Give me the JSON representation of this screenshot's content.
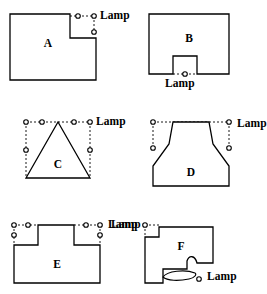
{
  "figure": {
    "stroke_color": "#000000",
    "fill_color": "#ffffff",
    "lamp_marker": "small-open-circle",
    "guide_style": "dashed",
    "panels": [
      {
        "id": "A",
        "label": "A",
        "lamp_label": "Lamp",
        "lamp_count": 3,
        "shape": "rectilinear-L-shape",
        "outline": "M10,14 L70,14 L70,38 L96,38 L96,80 L10,80 Z",
        "label_x": 48,
        "label_y": 47,
        "guides": [
          {
            "x1": 70,
            "y1": 16,
            "x2": 96,
            "y2": 16
          },
          {
            "x1": 94,
            "y1": 16,
            "x2": 94,
            "y2": 33
          }
        ],
        "lamps": [
          {
            "cx": 78,
            "cy": 16
          },
          {
            "cx": 94,
            "cy": 16
          },
          {
            "cx": 94,
            "cy": 32
          }
        ],
        "lamp_label_x": 100,
        "lamp_label_y": 10
      },
      {
        "id": "B",
        "label": "B",
        "lamp_label": "Lamp",
        "lamp_count": 1,
        "shape": "rectangle-with-bottom-notch",
        "outline": "M16,14 L96,14 L96,74 L64,74 L64,56 L40,56 L40,74 L16,74 Z",
        "label_x": 56,
        "label_y": 42,
        "guides": [
          {
            "x1": 40,
            "y1": 74,
            "x2": 64,
            "y2": 74
          }
        ],
        "lamps": [
          {
            "cx": 52,
            "cy": 74
          }
        ],
        "lamp_label_x": 32,
        "lamp_label_y": 78
      },
      {
        "id": "C",
        "label": "C",
        "lamp_label": "Lamp",
        "lamp_count": 6,
        "shape": "triangle-with-bounding-box",
        "outline": "M58,24 L90,80 L26,80 Z",
        "label_x": 58,
        "label_y": 68,
        "guides": [
          {
            "x1": 26,
            "y1": 24,
            "x2": 90,
            "y2": 24
          },
          {
            "x1": 26,
            "y1": 24,
            "x2": 26,
            "y2": 80
          },
          {
            "x1": 90,
            "y1": 24,
            "x2": 90,
            "y2": 80
          }
        ],
        "lamps": [
          {
            "cx": 26,
            "cy": 24
          },
          {
            "cx": 42,
            "cy": 24
          },
          {
            "cx": 74,
            "cy": 24
          },
          {
            "cx": 90,
            "cy": 24
          },
          {
            "cx": 26,
            "cy": 52
          },
          {
            "cx": 90,
            "cy": 52
          }
        ],
        "lamp_label_x": 96,
        "lamp_label_y": 18
      },
      {
        "id": "D",
        "label": "D",
        "lamp_label": "Lamp",
        "lamp_count": 4,
        "shape": "flask-shape",
        "outline": "M40,24 L76,24 L80,46 L96,68 L96,88 L20,88 L20,68 L36,46 Z",
        "label_x": 58,
        "label_y": 76,
        "guides": [
          {
            "x1": 20,
            "y1": 24,
            "x2": 96,
            "y2": 24
          },
          {
            "x1": 20,
            "y1": 24,
            "x2": 20,
            "y2": 50
          },
          {
            "x1": 96,
            "y1": 24,
            "x2": 96,
            "y2": 50
          }
        ],
        "lamps": [
          {
            "cx": 20,
            "cy": 24
          },
          {
            "cx": 96,
            "cy": 24
          },
          {
            "cx": 20,
            "cy": 50
          },
          {
            "cx": 96,
            "cy": 50
          }
        ],
        "lamp_label_x": 104,
        "lamp_label_y": 20
      },
      {
        "id": "E",
        "label": "E",
        "lamp_label": "Lamp",
        "lamp_count": 6,
        "shape": "rectilinear-T-shape",
        "outline": "M38,22 L74,22 L74,42 L100,42 L100,80 L14,80 L14,42 L38,42 Z",
        "label_x": 57,
        "label_y": 63,
        "guides": [
          {
            "x1": 14,
            "y1": 22,
            "x2": 38,
            "y2": 22
          },
          {
            "x1": 14,
            "y1": 22,
            "x2": 14,
            "y2": 42
          },
          {
            "x1": 74,
            "y1": 22,
            "x2": 100,
            "y2": 22
          },
          {
            "x1": 100,
            "y1": 22,
            "x2": 100,
            "y2": 42
          }
        ],
        "lamps": [
          {
            "cx": 14,
            "cy": 22
          },
          {
            "cx": 28,
            "cy": 22
          },
          {
            "cx": 14,
            "cy": 32
          },
          {
            "cx": 86,
            "cy": 22
          },
          {
            "cx": 100,
            "cy": 22
          },
          {
            "cx": 100,
            "cy": 32
          }
        ],
        "lamp_label_x": 108,
        "lamp_label_y": 16
      },
      {
        "id": "F",
        "label": "F",
        "lamp_label_top": "Lamp",
        "lamp_label_bottom": "Lamp",
        "lamp_count": 2,
        "shape": "rectilinear-with-curved-notch",
        "outline": "M26,24 L80,24 L80,60 L64,60 C62,52 56,52 54,58 L54,66 L30,66 L30,80 L12,80 L12,34 L26,34 Z",
        "label_x": 48,
        "label_y": 47,
        "guides": [
          {
            "x1": 12,
            "y1": 22,
            "x2": 26,
            "y2": 22
          },
          {
            "x1": 12,
            "y1": 22,
            "x2": 12,
            "y2": 34
          }
        ],
        "curve": "M30,74 C34,68 52,66 62,70 C64,71 62,75 56,76 C46,78 34,78 30,74 Z",
        "lamps": [
          {
            "cx": 12,
            "cy": 22
          },
          {
            "cx": 66,
            "cy": 76
          }
        ],
        "lamp_label_top_x": -22,
        "lamp_label_top_y": 16,
        "lamp_label_bottom_x": 74,
        "lamp_label_bottom_y": 68
      }
    ]
  }
}
